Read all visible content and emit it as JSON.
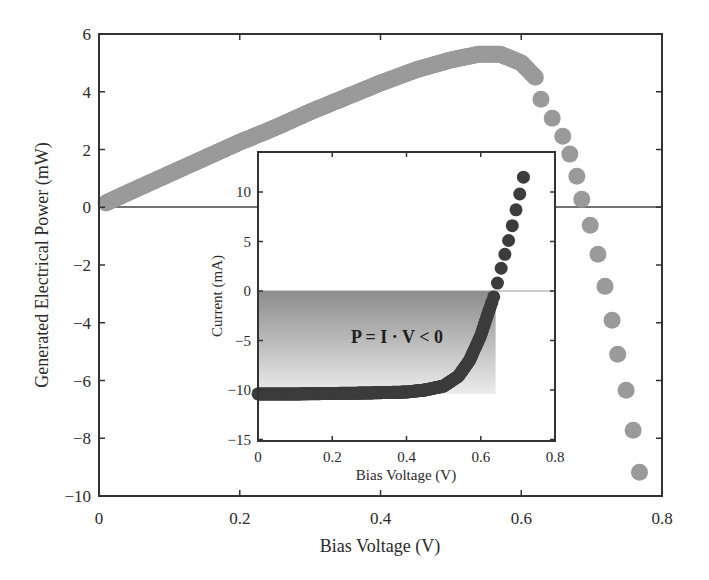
{
  "chart_data": [
    {
      "type": "scatter",
      "title": "",
      "xlabel": "Bias Voltage (V)",
      "ylabel": "Generated Electrical Power (mW)",
      "xlim": [
        0,
        0.8
      ],
      "ylim": [
        -10,
        6
      ],
      "xticks": [
        0,
        0.2,
        0.4,
        0.6,
        0.8
      ],
      "xtick_labels": [
        "0",
        "0.2",
        "0.4",
        "0.6",
        "0.8"
      ],
      "yticks": [
        6,
        4,
        2,
        0,
        -2,
        -4,
        -6,
        -8,
        -10
      ],
      "ytick_labels": [
        "6",
        "4",
        "2",
        "0",
        "−2",
        "−4",
        "−6",
        "−8",
        "−10"
      ],
      "grid": false,
      "zero_line": true,
      "marker_color": "#9a9a9a",
      "series": [
        {
          "name": "Generated power",
          "x": [
            0.01,
            0.05,
            0.1,
            0.15,
            0.2,
            0.25,
            0.3,
            0.35,
            0.4,
            0.45,
            0.5,
            0.54,
            0.57,
            0.6,
            0.62,
            0.628,
            0.644,
            0.659,
            0.669,
            0.679,
            0.686,
            0.698,
            0.709,
            0.719,
            0.729,
            0.737,
            0.749,
            0.759,
            0.768
          ],
          "y": [
            0.15,
            0.6,
            1.15,
            1.7,
            2.25,
            2.75,
            3.3,
            3.8,
            4.3,
            4.75,
            5.1,
            5.3,
            5.3,
            5.0,
            4.5,
            3.74,
            3.08,
            2.46,
            1.84,
            1.07,
            0.28,
            -0.62,
            -1.63,
            -2.74,
            -3.91,
            -5.09,
            -6.34,
            -7.72,
            -9.18
          ]
        }
      ]
    },
    {
      "type": "scatter",
      "title": "",
      "xlabel": "Bias Voltage (V)",
      "ylabel": "Current (mA)",
      "xlim": [
        0,
        0.8
      ],
      "ylim": [
        -15,
        14
      ],
      "xticks": [
        0,
        0.2,
        0.4,
        0.6,
        0.8
      ],
      "xtick_labels": [
        "0",
        "0.2",
        "0.4",
        "0.6",
        "0.8"
      ],
      "yticks": [
        10,
        5,
        0,
        -5,
        -10,
        -15
      ],
      "ytick_labels": [
        "10",
        "5",
        "0",
        "−5",
        "−10",
        "−15"
      ],
      "grid": false,
      "marker_color": "#3c3c3c",
      "shaded_region": {
        "label": "P = I · V < 0",
        "y_range": [
          -10.4,
          0
        ]
      },
      "annotation": "P = I · V < 0",
      "series": [
        {
          "name": "I-V curve",
          "x": [
            0.0,
            0.1,
            0.2,
            0.3,
            0.4,
            0.45,
            0.5,
            0.54,
            0.57,
            0.6,
            0.62,
            0.635,
            0.645,
            0.655,
            0.665,
            0.675,
            0.685,
            0.695,
            0.705,
            0.715
          ],
          "y": [
            -10.4,
            -10.4,
            -10.35,
            -10.3,
            -10.2,
            -10.0,
            -9.6,
            -8.6,
            -7.0,
            -4.5,
            -2.2,
            -0.6,
            0.8,
            2.3,
            3.7,
            5.1,
            6.6,
            8.2,
            9.8,
            11.5
          ]
        }
      ]
    }
  ],
  "main": {
    "xlabel": "Bias Voltage (V)",
    "ylabel": "Generated Electrical Power (mW)",
    "xtick_labels": [
      "0",
      "0.2",
      "0.4",
      "0.6",
      "0.8"
    ],
    "ytick_labels": [
      "6",
      "4",
      "2",
      "0",
      "−2",
      "−4",
      "−6",
      "−8",
      "−10"
    ]
  },
  "inset": {
    "xlabel": "Bias Voltage (V)",
    "ylabel": "Current (mA)",
    "annotation": "P = I · V < 0",
    "xtick_labels": [
      "0",
      "0.2",
      "0.4",
      "0.6",
      "0.8"
    ],
    "ytick_labels": [
      "10",
      "5",
      "0",
      "−5",
      "−10",
      "−15"
    ]
  }
}
